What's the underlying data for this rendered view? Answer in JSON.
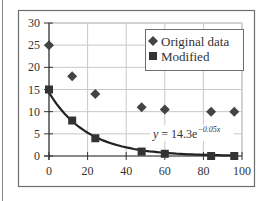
{
  "chart_data": {
    "type": "scatter",
    "title": "",
    "xlabel": "",
    "ylabel": "",
    "xlim": [
      0,
      100
    ],
    "ylim": [
      0,
      30
    ],
    "x_ticks": [
      0,
      20,
      40,
      60,
      80,
      100
    ],
    "y_ticks": [
      0,
      5,
      10,
      15,
      20,
      25,
      30
    ],
    "grid": true,
    "legend_position": "upper right",
    "series": [
      {
        "name": "Original data",
        "marker": "diamond",
        "color": "#444444",
        "x": [
          0,
          12,
          24,
          48,
          60,
          84,
          96
        ],
        "y": [
          25,
          18,
          14,
          11,
          10.5,
          10,
          10
        ]
      },
      {
        "name": "Modified",
        "marker": "square",
        "color": "#333333",
        "x": [
          0,
          12,
          24,
          48,
          60,
          84,
          96
        ],
        "y": [
          15,
          8,
          4,
          1,
          0.5,
          0,
          0
        ]
      }
    ],
    "fit_curve": {
      "label": "y = 14.3e^(-0.05x)",
      "a": 14.3,
      "b": -0.05,
      "applies_to": "Modified"
    },
    "annotations": [
      {
        "text_main": "y = 14.3e",
        "text_sup": "−0.05x"
      }
    ]
  },
  "legend": {
    "items": [
      {
        "label": "Original data",
        "marker": "diamond"
      },
      {
        "label": "Modified",
        "marker": "square"
      }
    ]
  },
  "equation": {
    "main": "y = 14.3e",
    "sup": "−0.05x"
  }
}
